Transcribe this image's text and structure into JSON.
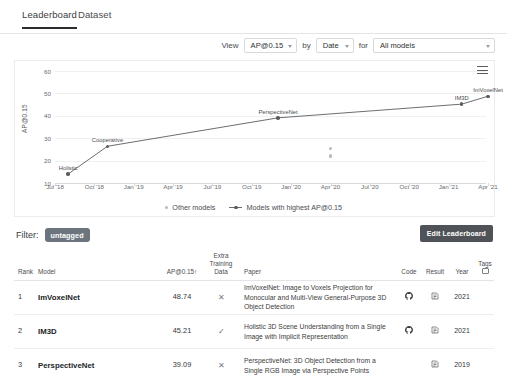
{
  "tabs": [
    {
      "label": "Leaderboard",
      "active": true
    },
    {
      "label": "Dataset",
      "active": false
    }
  ],
  "controls": {
    "view_label": "View",
    "metric_value": "AP@0.15",
    "by_label": "by",
    "by_value": "Date",
    "for_label": "for",
    "models_value": "All models"
  },
  "chart_menu_name": "chart-menu-icon",
  "filter": {
    "label": "Filter:",
    "tag": "untagged"
  },
  "edit_button": "Edit Leaderboard",
  "legend": [
    {
      "label": "Other models",
      "color": "#b9babd"
    },
    {
      "label": "Models with highest AP@0.15",
      "color": "#5b5c60"
    }
  ],
  "table": {
    "headers": {
      "rank": "Rank",
      "model": "Model",
      "score": "AP@0.15↑",
      "extra": "Extra Training Data",
      "paper": "Paper",
      "code": "Code",
      "result": "Result",
      "year": "Year",
      "tags": "Tags"
    },
    "rows": [
      {
        "rank": "1",
        "model": "ImVoxelNet",
        "score": "48.74",
        "extra": "✕",
        "paper": "ImVoxelNet: Image to Voxels Projection for Monocular and Multi-View General-Purpose 3D Object Detection",
        "code": "github-icon",
        "result": "result-icon",
        "year": "2021"
      },
      {
        "rank": "2",
        "model": "IM3D",
        "score": "45.21",
        "extra": "✓",
        "paper": "Holistic 3D Scene Understanding from a Single Image with Implicit Representation",
        "code": "github-icon",
        "result": "result-icon",
        "year": "2021"
      },
      {
        "rank": "3",
        "model": "PerspectiveNet",
        "score": "39.09",
        "extra": "✕",
        "paper": "PerspectiveNet: 3D Object Detection from a Single RGB Image via Perspective Points",
        "code": "",
        "result": "result-icon",
        "year": "2019"
      }
    ]
  },
  "chart_data": {
    "type": "line",
    "title": "",
    "xlabel": "",
    "ylabel": "AP@0.15",
    "ylim": [
      10,
      60
    ],
    "yticks": [
      10,
      20,
      30,
      40,
      50,
      60
    ],
    "xticks": [
      "Jul '18",
      "Oct '18",
      "Jan '19",
      "Apr '19",
      "Jul '19",
      "Oct '19",
      "Jan '20",
      "Apr '20",
      "Jul '20",
      "Oct '20",
      "Jan '21",
      "Apr '21"
    ],
    "grid": true,
    "legend_position": "bottom",
    "series": [
      {
        "name": "Models with highest AP@0.15",
        "color": "#5b5c60",
        "points": [
          {
            "label": "Holistic",
            "x": "Aug '18",
            "y": 14.0
          },
          {
            "label": "Cooperative",
            "x": "Nov '18",
            "y": 26.4
          },
          {
            "label": "PerspectiveNet",
            "x": "Dec '19",
            "y": 39.09
          },
          {
            "label": "IM3D",
            "x": "Feb '21",
            "y": 45.21
          },
          {
            "label": "ImVoxelNet",
            "x": "Apr '21",
            "y": 48.74
          }
        ]
      },
      {
        "name": "Other models",
        "color": "#b9babd",
        "points": [
          {
            "label": "",
            "x": "Apr '20",
            "y": 25.5
          },
          {
            "label": "",
            "x": "Apr '20",
            "y": 22.0
          }
        ]
      }
    ]
  }
}
